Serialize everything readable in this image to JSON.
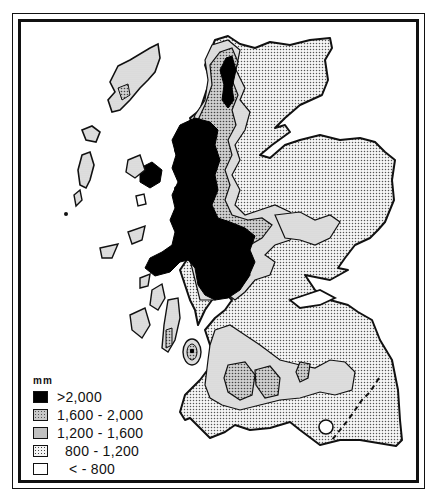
{
  "map": {
    "subject": "Annual rainfall, Scotland",
    "regions_depicted": [
      "Outer Hebrides",
      "Inner Hebrides",
      "Western Highlands",
      "Eastern Highlands",
      "Southern Uplands",
      "Central Lowlands"
    ],
    "features": [
      "dashed-border-line",
      "inner-lake-circle"
    ]
  },
  "legend": {
    "unit": "mm",
    "items": [
      {
        "label": ">2,000",
        "pattern": "solid-black",
        "color": "#000000"
      },
      {
        "label": "1,600 - 2,000",
        "pattern": "dense-stipple",
        "color": "#c8c8c8"
      },
      {
        "label": "1,200 - 1,600",
        "pattern": "light-fine-dot",
        "color": "#e4e4e4"
      },
      {
        "label": "800 - 1,200",
        "pattern": "sparse-stipple",
        "color": "#f0f0f0"
      },
      {
        "label": "< - 800",
        "pattern": "white",
        "color": "#ffffff"
      }
    ]
  }
}
